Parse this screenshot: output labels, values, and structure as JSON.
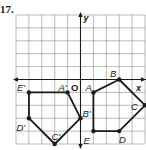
{
  "problem_number": "17.",
  "axes": {
    "x_label": "x",
    "y_label": "y",
    "origin_label": "O"
  },
  "grid": {
    "unit_px": 12.9,
    "origin_px": [
      80.5,
      79.5
    ],
    "x_range": [
      -5,
      5
    ],
    "y_range": [
      -5,
      5
    ]
  },
  "colors": {
    "line": "#1a1a1a",
    "grid": "#8a8a8a",
    "background": "#ffffff"
  },
  "chart_data": {
    "type": "diagram",
    "title": "17.",
    "xlabel": "x",
    "ylabel": "y",
    "grid": true,
    "polygons": [
      {
        "name": "ABCDE",
        "vertices": [
          {
            "label": "A",
            "x": 1,
            "y": -1
          },
          {
            "label": "B",
            "x": 3,
            "y": 0
          },
          {
            "label": "C",
            "x": 5,
            "y": -2
          },
          {
            "label": "D",
            "x": 3,
            "y": -4
          },
          {
            "label": "E",
            "x": 1,
            "y": -4
          }
        ]
      },
      {
        "name": "A'B'C'D'E'",
        "vertices": [
          {
            "label": "A'",
            "x": -1,
            "y": -1
          },
          {
            "label": "B'",
            "x": 0,
            "y": -3
          },
          {
            "label": "C'",
            "x": -2,
            "y": -5
          },
          {
            "label": "D'",
            "x": -4,
            "y": -3
          },
          {
            "label": "E'",
            "x": -4,
            "y": -1
          }
        ]
      }
    ]
  }
}
